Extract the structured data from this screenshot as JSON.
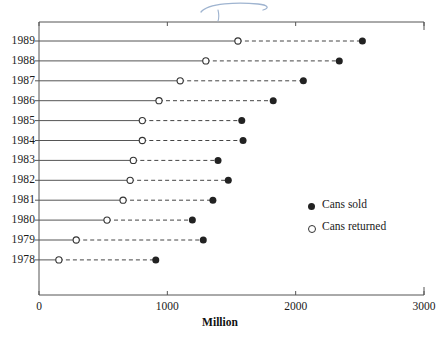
{
  "chart_data": {
    "type": "scatter",
    "subtype": "dumbbell",
    "title": "",
    "xlabel": "Million",
    "ylabel": "",
    "xlim": [
      0,
      3000
    ],
    "xticks": [
      0,
      1000,
      2000,
      3000
    ],
    "xtick_labels": [
      "0",
      "1000",
      "2000",
      "3000"
    ],
    "categories": [
      "1989",
      "1988",
      "1987",
      "1986",
      "1985",
      "1984",
      "1983",
      "1982",
      "1981",
      "1980",
      "1979",
      "1978"
    ],
    "grid": false,
    "legend_position": "center-right",
    "series": [
      {
        "name": "Cans sold",
        "marker": "filled-circle",
        "color": "#222222",
        "values": [
          2520,
          2340,
          2060,
          1825,
          1580,
          1590,
          1395,
          1475,
          1355,
          1195,
          1280,
          910
        ]
      },
      {
        "name": "Cans returned",
        "marker": "open-circle",
        "color": "#ffffff",
        "edge_color": "#333333",
        "values": [
          1550,
          1300,
          1100,
          935,
          805,
          805,
          735,
          710,
          655,
          530,
          290,
          155
        ]
      }
    ],
    "connector_style": "dashed",
    "baseline_style": "solid"
  },
  "axes": {
    "y_tick_labels": [
      "1989",
      "1988",
      "1987",
      "1986",
      "1985",
      "1984",
      "1983",
      "1982",
      "1981",
      "1980",
      "1979",
      "1978"
    ],
    "x_tick_labels": [
      "0",
      "1000",
      "2000",
      "3000"
    ],
    "x_axis_title": "Million"
  },
  "legend": {
    "entries": [
      {
        "label": "Cans sold",
        "marker": "filled-circle"
      },
      {
        "label": "Cans returned",
        "marker": "open-circle"
      }
    ]
  },
  "annotations": {
    "handwritten_mark": "pen-scribble"
  },
  "colors": {
    "axis": "#555555",
    "marker_filled": "#222222",
    "marker_open_edge": "#333333",
    "text": "#1a1a1a",
    "handmark": "#8fa8c8"
  }
}
